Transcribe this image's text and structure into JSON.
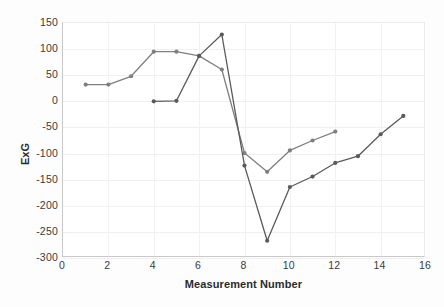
{
  "chart_data": {
    "type": "line",
    "title": "",
    "xlabel": "Measurement Number",
    "ylabel": "ExG",
    "xlim": [
      0,
      16
    ],
    "ylim": [
      -300,
      150
    ],
    "xticks": [
      0,
      2,
      4,
      6,
      8,
      10,
      12,
      14,
      16
    ],
    "yticks": [
      150,
      100,
      50,
      0,
      -50,
      -100,
      -150,
      -200,
      -250,
      -300
    ],
    "grid": true,
    "legend": "none",
    "series": [
      {
        "name": "series-1",
        "color": "#7f7f7f",
        "x": [
          1,
          2,
          3,
          4,
          5,
          6,
          7,
          8,
          9,
          10,
          11,
          12
        ],
        "values": [
          32,
          32,
          48,
          95,
          95,
          87,
          61,
          -99,
          -135,
          -94,
          -75,
          -58
        ]
      },
      {
        "name": "series-2",
        "color": "#5a5a5a",
        "x": [
          4,
          5,
          6,
          7,
          8,
          9,
          10,
          11,
          12,
          13,
          14,
          15
        ],
        "values": [
          0,
          1,
          87,
          128,
          -123,
          -267,
          -164,
          -144,
          -118,
          -105,
          -63,
          -28
        ]
      }
    ]
  },
  "axis": {
    "x_title": "Measurement Number",
    "y_title": "ExG",
    "x_tick_labels": [
      "0",
      "2",
      "4",
      "6",
      "8",
      "10",
      "12",
      "14",
      "16"
    ],
    "y_tick_labels": [
      "150",
      "100",
      "50",
      "0",
      "-50",
      "-100",
      "-150",
      "-200",
      "-250",
      "-300"
    ]
  },
  "colors": {
    "series_1": "#7f7f7f",
    "series_2": "#5a5a5a",
    "grid": "#f0f0f0",
    "axis": "#c9c9c9",
    "text": "#3b3b3b",
    "background": "#ffffff"
  }
}
